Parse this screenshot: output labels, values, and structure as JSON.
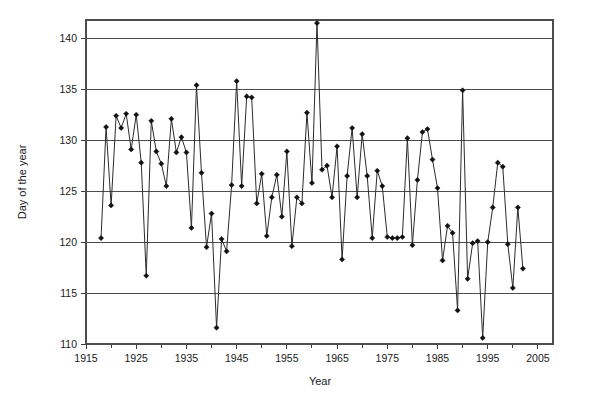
{
  "chart_data": {
    "type": "line",
    "title": "",
    "subtitle": "",
    "xlabel": "Year",
    "ylabel": "Day of the year",
    "xlim": [
      1915,
      2008
    ],
    "ylim": [
      110,
      141.8
    ],
    "xticks": [
      1915,
      1925,
      1935,
      1945,
      1955,
      1965,
      1975,
      1985,
      1995,
      2005
    ],
    "xtick_labels": [
      "1915",
      "1925",
      "1935",
      "1945",
      "1955",
      "1965",
      "1975",
      "1985",
      "1995",
      "2005"
    ],
    "xtick_minor_step": 5,
    "yticks": [
      110,
      115,
      120,
      125,
      130,
      135,
      140
    ],
    "ytick_labels": [
      "110",
      "115",
      "120",
      "125",
      "130",
      "135",
      "140"
    ],
    "grid": "horizontal",
    "legend": "none",
    "marker": "diamond",
    "line_color": "#2b2b2b",
    "marker_color": "#111111",
    "grid_color": "#4d4d4d",
    "x": [
      1918,
      1919,
      1920,
      1921,
      1922,
      1923,
      1924,
      1925,
      1926,
      1927,
      1928,
      1929,
      1930,
      1931,
      1932,
      1933,
      1934,
      1935,
      1936,
      1937,
      1938,
      1939,
      1940,
      1941,
      1942,
      1943,
      1944,
      1945,
      1946,
      1947,
      1948,
      1949,
      1950,
      1951,
      1952,
      1953,
      1954,
      1955,
      1956,
      1957,
      1958,
      1959,
      1960,
      1961,
      1962,
      1963,
      1964,
      1965,
      1966,
      1967,
      1968,
      1969,
      1970,
      1971,
      1972,
      1973,
      1974,
      1975,
      1976,
      1977,
      1978,
      1979,
      1980,
      1981,
      1982,
      1983,
      1984,
      1985,
      1986,
      1987,
      1988,
      1989,
      1990,
      1991,
      1992,
      1993,
      1994,
      1995,
      1996,
      1997,
      1998,
      1999,
      2000,
      2001,
      2002,
      2003,
      2004,
      2005,
      2006,
      2007
    ],
    "y": [
      120.4,
      131.3,
      123.6,
      132.4,
      131.2,
      132.6,
      129.1,
      132.5,
      127.8,
      116.7,
      131.9,
      128.9,
      127.7,
      125.5,
      132.1,
      128.8,
      130.3,
      128.8,
      121.4,
      135.4,
      126.8,
      119.5,
      122.8,
      111.6,
      120.3,
      119.1,
      125.6,
      135.8,
      125.5,
      134.3,
      134.2,
      123.8,
      126.7,
      120.6,
      124.4,
      126.6,
      122.5,
      128.9,
      119.6,
      124.4,
      123.8,
      132.7,
      125.8,
      141.5,
      127.1,
      127.5,
      124.4,
      129.4,
      118.3,
      126.5,
      131.2,
      124.4,
      130.6,
      126.5,
      120.4,
      127.0,
      125.5,
      120.5,
      120.4,
      120.4,
      120.5,
      130.2,
      119.7,
      126.1,
      130.8,
      131.1,
      128.1,
      125.3,
      118.2,
      121.6,
      120.9,
      113.3,
      134.9,
      116.4,
      119.9,
      120.1,
      110.6,
      120.0,
      123.4,
      127.8,
      127.4,
      119.8,
      115.5,
      123.4,
      117.4
    ]
  },
  "axes": {
    "y_axis_label": "Day of the year",
    "x_axis_label": "Year"
  }
}
